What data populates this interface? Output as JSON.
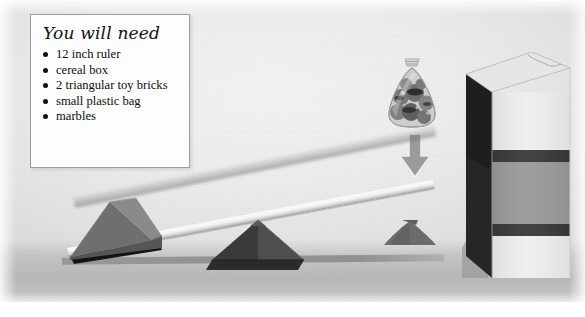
{
  "scene": {
    "title": "balance-lever-science-activity-illustration",
    "background_color": "#ececec",
    "floor_color": "#b0b0b0"
  },
  "materials_box": {
    "heading": "You will need",
    "items": [
      "12 inch ruler",
      "cereal box",
      "2 triangular toy bricks",
      "small plastic bag",
      "marbles"
    ],
    "border_color": "#9d9d9d",
    "fill_color": "#fdfdfd"
  },
  "objects": {
    "ruler": {
      "label": "12 inch ruler",
      "color": "#f3f3f3",
      "edge_color": "#9c9c9c"
    },
    "brick_left": {
      "label": "triangular toy brick (left, under raised ruler end)",
      "top_face_color": "#8a8a8a",
      "front_face_color": "#6f6f6f",
      "side_face_color": "#585858"
    },
    "brick_middle": {
      "label": "triangular toy brick (fulcrum)",
      "left_face_color": "#3d3d3d",
      "right_face_color": "#4e4e4e",
      "base_color": "#2c2c2c"
    },
    "cone_right": {
      "label": "dark cone shadow under right ruler end",
      "color": "#6a6a6a"
    },
    "marble_bag": {
      "label": "small plastic bag of marbles",
      "bag_color": "#cfcfcf",
      "marble_color": "#6b6b6b",
      "tie_color": "#d8d8d8"
    },
    "arrow": {
      "label": "downward force arrow",
      "direction": "down",
      "color": "#9a9a9a",
      "outline_color": "#e8e8e8"
    },
    "cereal_box": {
      "label": "cereal box",
      "top_face_color": "#e4e4e4",
      "front_face_color": "#ededed",
      "band_color": "#8f8f8f",
      "stripe_color": "#3a3a3a",
      "side_face_color": "#2a2a2a"
    }
  }
}
